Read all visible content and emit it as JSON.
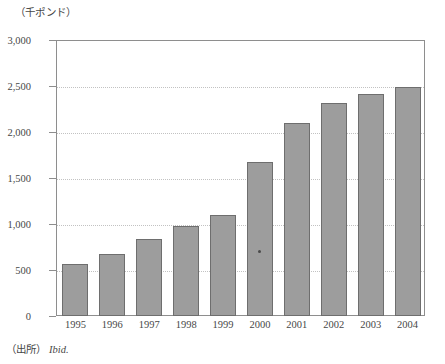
{
  "figure": {
    "unit_label": "（千ポンド）",
    "source_prefix": "（出所）",
    "source_value": "Ibid."
  },
  "chart_data": {
    "type": "bar",
    "title": "",
    "subtitle": "",
    "xlabel": "",
    "ylabel": "（千ポンド）",
    "categories": [
      "1995",
      "1996",
      "1997",
      "1998",
      "1999",
      "2000",
      "2001",
      "2002",
      "2003",
      "2004"
    ],
    "values": [
      560,
      670,
      840,
      980,
      1100,
      1670,
      2100,
      2310,
      2410,
      2490
    ],
    "series": [
      {
        "name": "",
        "values": [
          560,
          670,
          840,
          980,
          1100,
          1670,
          2100,
          2310,
          2410,
          2490
        ]
      }
    ],
    "ylim": [
      0,
      3000
    ],
    "ytick_values": [
      0,
      500,
      1000,
      1500,
      2000,
      2500,
      3000
    ],
    "ytick_labels": [
      "0",
      "500",
      "1,000",
      "1,500",
      "2,000",
      "2,500",
      "3,000"
    ],
    "grid": true,
    "grid_axis": "y",
    "legend": false,
    "legend_position": "none",
    "bar_color": "#9d9d9d",
    "bar_edge_color": "#6e6e6e",
    "grid_color": "#c2c2c2",
    "frame_color": "#8e8e8e",
    "text_color": "#474747",
    "annotations": [
      {
        "name": "scan-speck",
        "category": "2000",
        "value": 700
      }
    ]
  }
}
